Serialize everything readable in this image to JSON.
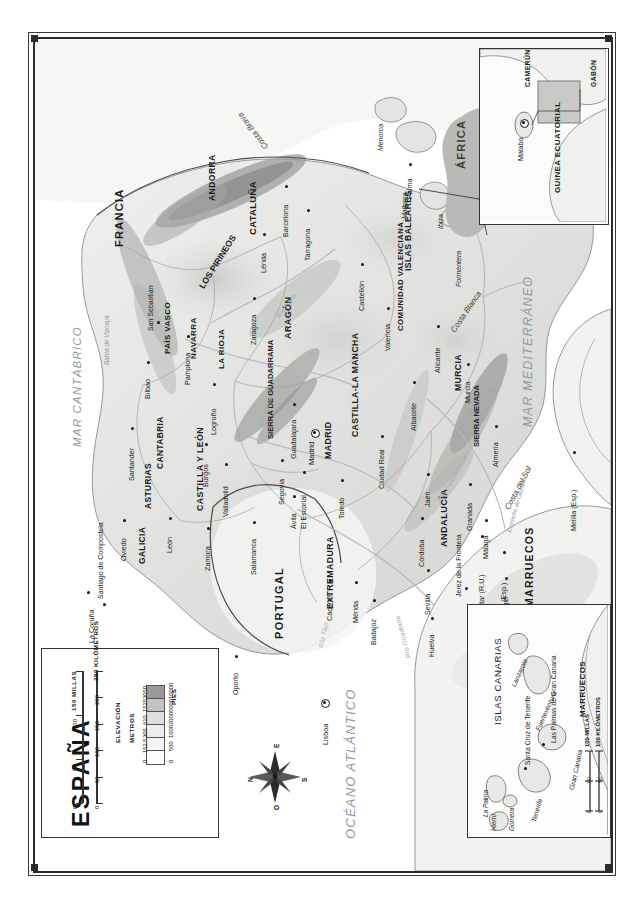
{
  "map": {
    "title": "ESPAÑA",
    "countries": [
      "FRANCIA",
      "PORTUGAL",
      "MARRUECOS",
      "ARGELIA",
      "ANDORRA"
    ],
    "regions": [
      "GALICIA",
      "ASTURIAS",
      "CANTABRIA",
      "PAÍS VASCO",
      "NAVARRA",
      "LA RIOJA",
      "ARAGÓN",
      "CATALUÑA",
      "CASTILLA Y LEÓN",
      "MADRID",
      "CASTILLA-LA MANCHA",
      "COMUNIDAD VALENCIANA",
      "MURCIA",
      "EXTREMADURA",
      "ANDALUCÍA",
      "ISLAS BALEARES"
    ],
    "cities": [
      "La Coruña",
      "Santiago de Compostela",
      "Vigo",
      "Oviedo",
      "Santander",
      "Bilbao",
      "San Sebastián",
      "Pamplona",
      "Logroño",
      "Burgos",
      "Valladolid",
      "León",
      "Zamora",
      "Salamanca",
      "Segovia",
      "Ávila",
      "El Escorial",
      "Madrid",
      "Guadalajara",
      "Toledo",
      "Ciudad Real",
      "Zaragoza",
      "Lérida",
      "Barcelona",
      "Tarragona",
      "Castellón",
      "Valencia",
      "Alicante",
      "Albacete",
      "Murcia",
      "Almería",
      "Granada",
      "Jaén",
      "Córdoba",
      "Sevilla",
      "Málaga",
      "Jerez de la Frontera",
      "Cádiz",
      "Huelva",
      "Badajoz",
      "Mérida",
      "Cáceres",
      "Oporto",
      "Lisboa",
      "Tánger",
      "Palma",
      "Melilla (Esp.)",
      "Ceuta (Esp.)",
      "Gibraltar (R.U.)"
    ],
    "capital": "Madrid",
    "water_bodies": [
      "MAR CANTÁBRICO",
      "OCÉANO ATLÁNTICO",
      "MAR MEDITERRÁNEO",
      "Bahía de Vizcaya"
    ],
    "rivers": [
      "Río Ebro",
      "Río Duero",
      "Río Tajo",
      "Río Guadiana",
      "Río Guadalquivir"
    ],
    "mountains": [
      "LOS PIRINEOS",
      "SIERRA DE GUADARRAMA",
      "SIERRA NEVADA"
    ],
    "coasts": [
      "Costa Brava",
      "Costa Blanca",
      "Costa del Sol",
      "Estrecho de Gibraltar"
    ],
    "islands": [
      "Menorca",
      "Mallorca",
      "Ibiza",
      "Formentera"
    ],
    "africa_label": "ÁFRICA"
  },
  "scale": {
    "miles_ticks": [
      "0",
      "50",
      "100",
      "150"
    ],
    "miles_unit": "MILLAS",
    "miles_unit_full": "150 MILLAS",
    "km_ticks": [
      "0",
      "50",
      "100",
      "150",
      "200",
      "250"
    ],
    "km_unit": "KILÓMETROS",
    "km_unit_full": "250 KILÓMETROS"
  },
  "elevation": {
    "header": "ELEVACIÓN",
    "col_meters": "METROS",
    "col_feet": "PIES",
    "rows": [
      {
        "meters": "3050",
        "feet": "10000",
        "color": "#9a9a9a"
      },
      {
        "meters": "1525",
        "feet": "5000",
        "color": "#c2c2c2"
      },
      {
        "meters": "610",
        "feet": "2000",
        "color": "#dedede"
      },
      {
        "meters": "305",
        "feet": "1000",
        "color": "#ececec"
      },
      {
        "meters": "152.5",
        "feet": "500",
        "color": "#f4f4f4"
      },
      {
        "meters": "0",
        "feet": "0",
        "color": "#fbfbfb"
      }
    ]
  },
  "compass": {
    "n": "N",
    "e": "E",
    "s": "S",
    "o": "O"
  },
  "guinea_inset": {
    "title": "GUINEA ECUATORIAL",
    "capital": "Malabo",
    "neighbors": [
      "CAMERÚN",
      "GABÓN"
    ]
  },
  "canarias_inset": {
    "title": "ISLAS CANARIAS",
    "islands": [
      "La Palma",
      "Gomera",
      "Hierro",
      "Tenerife",
      "Gran Canaria",
      "Fuerteventura",
      "Lanzarote"
    ],
    "cities": [
      "Santa Cruz de Tenerife",
      "Las Palmas de Gran Canaria"
    ],
    "country": "MARRUECOS",
    "scale_miles_ticks": [
      "0",
      "50",
      "100"
    ],
    "scale_miles_unit": "100 MILLAS",
    "scale_km_ticks": [
      "0",
      "50",
      "100"
    ],
    "scale_km_unit": "100 KILÓMETROS"
  },
  "colors": {
    "frame": "#2b2b2b",
    "land_low": "#f2f2f0",
    "land_mid": "#d8d8d6",
    "land_high": "#a8a8a6",
    "water": "#ffffff",
    "water_text": "#8e9aa3",
    "river": "#9aa7b0"
  }
}
